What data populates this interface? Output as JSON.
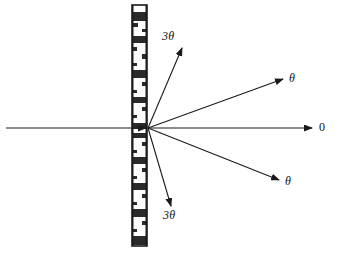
{
  "figure": {
    "background_color": "#ffffff",
    "line_color": "#1a1a1a",
    "width": 337,
    "height": 253
  },
  "grating": {
    "name": "diffraction-grating",
    "orientation": "vertical",
    "x": 132,
    "y_top": 5,
    "y_bottom": 246,
    "width": 15,
    "border_color": "#1a1a1a",
    "fill_color": "#fdfdfd",
    "stripe_color": "#2a2a2a",
    "stripes": [
      {
        "y": 7,
        "h": 9,
        "x": 0,
        "w": 15
      },
      {
        "y": 18,
        "h": 4,
        "x": 0,
        "w": 6
      },
      {
        "y": 24,
        "h": 3,
        "x": 9,
        "w": 6
      },
      {
        "y": 31,
        "h": 7,
        "x": 0,
        "w": 15
      },
      {
        "y": 42,
        "h": 4,
        "x": 0,
        "w": 5
      },
      {
        "y": 49,
        "h": 5,
        "x": 9,
        "w": 6
      },
      {
        "y": 58,
        "h": 3,
        "x": 0,
        "w": 5
      },
      {
        "y": 65,
        "h": 8,
        "x": 0,
        "w": 15
      },
      {
        "y": 77,
        "h": 4,
        "x": 9,
        "w": 6
      },
      {
        "y": 85,
        "h": 3,
        "x": 0,
        "w": 5
      },
      {
        "y": 92,
        "h": 6,
        "x": 0,
        "w": 15
      },
      {
        "y": 102,
        "h": 4,
        "x": 9,
        "w": 6
      },
      {
        "y": 110,
        "h": 3,
        "x": 0,
        "w": 5
      },
      {
        "y": 118,
        "h": 6,
        "x": 0,
        "w": 15
      },
      {
        "y": 128,
        "h": 5,
        "x": 0,
        "w": 15
      },
      {
        "y": 137,
        "h": 4,
        "x": 9,
        "w": 6
      },
      {
        "y": 145,
        "h": 3,
        "x": 0,
        "w": 5
      },
      {
        "y": 152,
        "h": 7,
        "x": 0,
        "w": 15
      },
      {
        "y": 163,
        "h": 4,
        "x": 9,
        "w": 6
      },
      {
        "y": 171,
        "h": 3,
        "x": 0,
        "w": 5
      },
      {
        "y": 178,
        "h": 7,
        "x": 0,
        "w": 15
      },
      {
        "y": 189,
        "h": 4,
        "x": 9,
        "w": 6
      },
      {
        "y": 197,
        "h": 3,
        "x": 0,
        "w": 5
      },
      {
        "y": 204,
        "h": 8,
        "x": 0,
        "w": 15
      },
      {
        "y": 216,
        "h": 4,
        "x": 9,
        "w": 6
      },
      {
        "y": 224,
        "h": 3,
        "x": 0,
        "w": 5
      },
      {
        "y": 231,
        "h": 9,
        "x": 0,
        "w": 15
      }
    ]
  },
  "diagram": {
    "center": {
      "x": 148,
      "y": 128
    },
    "incident_ray": {
      "name": "incident-beam",
      "x1": 6,
      "y1": 128,
      "x2": 146,
      "y2": 128,
      "has_arrow": true,
      "label": ""
    },
    "rays": [
      {
        "name": "ray-order-plus3",
        "label": "3θ",
        "x1": 148,
        "y1": 128,
        "x2": 182,
        "y2": 48,
        "label_x": 162,
        "label_y": 30,
        "italic": true
      },
      {
        "name": "ray-order-plus1",
        "label": "θ",
        "x1": 148,
        "y1": 128,
        "x2": 283,
        "y2": 79,
        "label_x": 289,
        "label_y": 72,
        "italic": true
      },
      {
        "name": "ray-order-zero",
        "label": "0",
        "x1": 148,
        "y1": 128,
        "x2": 312,
        "y2": 128,
        "label_x": 319,
        "label_y": 121,
        "italic": false
      },
      {
        "name": "ray-order-minus1",
        "label": "θ",
        "x1": 148,
        "y1": 128,
        "x2": 279,
        "y2": 180,
        "label_x": 285,
        "label_y": 175,
        "italic": true
      },
      {
        "name": "ray-order-minus3",
        "label": "3θ",
        "x1": 148,
        "y1": 128,
        "x2": 171,
        "y2": 206,
        "label_x": 163,
        "label_y": 209,
        "italic": true
      }
    ]
  }
}
